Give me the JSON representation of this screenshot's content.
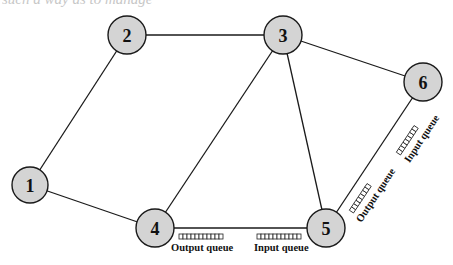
{
  "clipped_text": "such a way as to manage",
  "colors": {
    "node_fill": "#d4d4d4",
    "stroke": "#1a1a1a",
    "background": "#ffffff"
  },
  "nodes": [
    {
      "id": "1",
      "label": "1",
      "cx": 30,
      "cy": 185,
      "r": 18
    },
    {
      "id": "2",
      "label": "2",
      "cx": 127,
      "cy": 35,
      "r": 19
    },
    {
      "id": "3",
      "label": "3",
      "cx": 283,
      "cy": 35,
      "r": 19
    },
    {
      "id": "4",
      "label": "4",
      "cx": 155,
      "cy": 228,
      "r": 19
    },
    {
      "id": "5",
      "label": "5",
      "cx": 326,
      "cy": 228,
      "r": 19
    },
    {
      "id": "6",
      "label": "6",
      "cx": 423,
      "cy": 82,
      "r": 19
    }
  ],
  "edges": [
    {
      "from": "1",
      "to": "2"
    },
    {
      "from": "1",
      "to": "4"
    },
    {
      "from": "2",
      "to": "3"
    },
    {
      "from": "3",
      "to": "4"
    },
    {
      "from": "3",
      "to": "5"
    },
    {
      "from": "3",
      "to": "6"
    },
    {
      "from": "4",
      "to": "5"
    },
    {
      "from": "5",
      "to": "6"
    }
  ],
  "queues": {
    "link_4_5": {
      "output_label": "Output queue",
      "input_label": "Input queue"
    },
    "link_5_6": {
      "output_label": "Output queue",
      "input_label": "Input queue"
    }
  }
}
